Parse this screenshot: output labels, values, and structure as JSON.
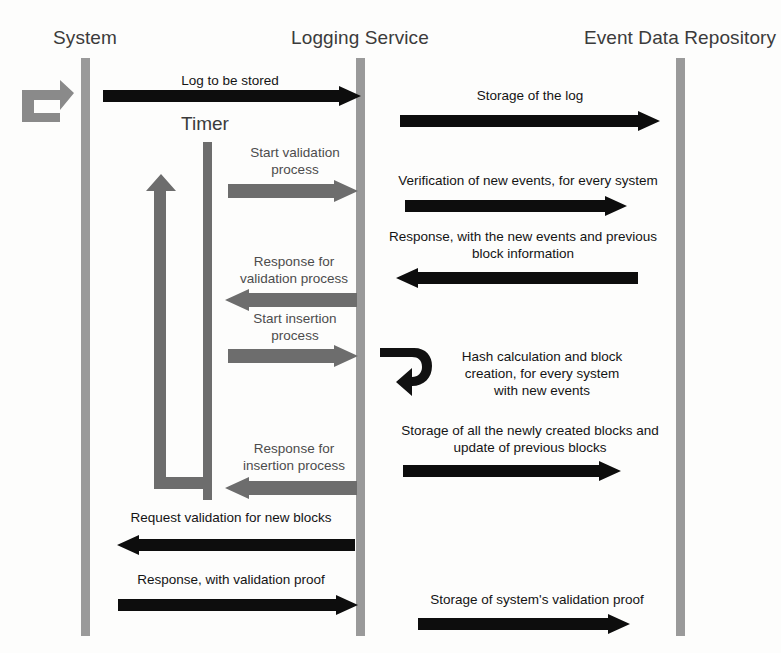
{
  "diagram": {
    "type": "sequence-diagram",
    "colors": {
      "background": "#fdfdfc",
      "lifeline_gray": "#9a9a9a",
      "timer_gray": "#6d6d6d",
      "arrow_black": "#0d0d0d",
      "arrow_gray": "#6d6d6d",
      "text_dark": "#141414",
      "text_header": "#3b3b3b"
    }
  },
  "actors": [
    {
      "id": "system",
      "label": "System"
    },
    {
      "id": "logging_service",
      "label": "Logging Service"
    },
    {
      "id": "event_data_repository",
      "label": "Event Data Repository"
    }
  ],
  "timer": {
    "label": "Timer"
  },
  "messages": [
    {
      "id": "m1",
      "label": "Log to be stored",
      "from": "system",
      "to": "logging_service",
      "direction": "right",
      "style": "black"
    },
    {
      "id": "m2",
      "label": "Storage of the log",
      "from": "logging_service",
      "to": "event_data_repository",
      "direction": "right",
      "style": "black"
    },
    {
      "id": "m3",
      "label": "Start validation\nprocess",
      "from": "timer",
      "to": "logging_service",
      "direction": "right",
      "style": "gray"
    },
    {
      "id": "m4",
      "label": "Verification of new events, for every system",
      "from": "logging_service",
      "to": "event_data_repository",
      "direction": "right",
      "style": "black"
    },
    {
      "id": "m5",
      "label": "Response, with the new events and previous\nblock information",
      "from": "event_data_repository",
      "to": "logging_service",
      "direction": "left",
      "style": "black"
    },
    {
      "id": "m6",
      "label": "Response for\nvalidation process",
      "from": "logging_service",
      "to": "timer",
      "direction": "left",
      "style": "gray"
    },
    {
      "id": "m7",
      "label": "Start insertion\nprocess",
      "from": "timer",
      "to": "logging_service",
      "direction": "right",
      "style": "gray"
    },
    {
      "id": "m8",
      "label": "Hash calculation and block\ncreation, for every system\nwith new events",
      "from": "logging_service",
      "to": "logging_service",
      "direction": "self",
      "style": "black"
    },
    {
      "id": "m9",
      "label": "Storage of all the newly created blocks and\nupdate of previous blocks",
      "from": "logging_service",
      "to": "event_data_repository",
      "direction": "right",
      "style": "black"
    },
    {
      "id": "m10",
      "label": "Response for\ninsertion process",
      "from": "logging_service",
      "to": "timer",
      "direction": "left",
      "style": "gray"
    },
    {
      "id": "m11",
      "label": "Request validation for new blocks",
      "from": "logging_service",
      "to": "system",
      "direction": "left",
      "style": "black"
    },
    {
      "id": "m12",
      "label": "Response, with validation proof",
      "from": "system",
      "to": "logging_service",
      "direction": "right",
      "style": "black"
    },
    {
      "id": "m13",
      "label": "Storage of system's validation proof",
      "from": "logging_service",
      "to": "event_data_repository",
      "direction": "right",
      "style": "black"
    }
  ],
  "self_loops": [
    {
      "id": "system_loop",
      "actor": "system",
      "style": "gray"
    },
    {
      "id": "timer_loop",
      "actor": "timer",
      "style": "gray"
    },
    {
      "id": "logging_hash_loop",
      "actor": "logging_service",
      "style": "black"
    }
  ]
}
